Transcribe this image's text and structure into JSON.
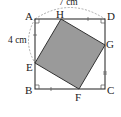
{
  "diagram": {
    "type": "geometry",
    "outer_square": "ABCD",
    "inner_square": "EFGH",
    "points": {
      "A": {
        "label": "A"
      },
      "B": {
        "label": "B"
      },
      "C": {
        "label": "C"
      },
      "D": {
        "label": "D"
      },
      "E": {
        "label": "E"
      },
      "F": {
        "label": "F"
      },
      "G": {
        "label": "G"
      },
      "H": {
        "label": "H"
      }
    },
    "measurements": {
      "AD": "7 cm",
      "AE": "4 cm"
    },
    "colors": {
      "line": "#333333",
      "fill": "#9a9a9a",
      "arc": "#999999"
    }
  }
}
